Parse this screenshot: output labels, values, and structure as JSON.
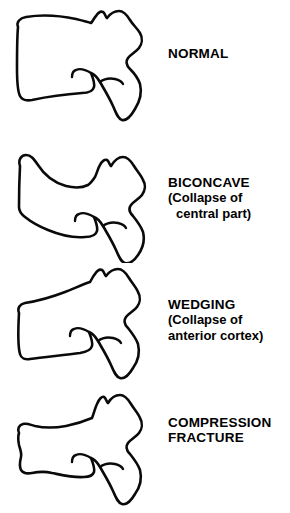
{
  "figure": {
    "background_color": "#ffffff",
    "line_color": "#0a0a0a"
  },
  "rows": [
    {
      "id": "normal",
      "title": "NORMAL",
      "sub1": "",
      "sub2": "",
      "drawing_name": "normal-vertebra-outline"
    },
    {
      "id": "biconcave",
      "title": "BICONCAVE",
      "sub1": "(Collapse of",
      "sub2": "central part)",
      "drawing_name": "biconcave-vertebra-outline"
    },
    {
      "id": "wedging",
      "title": "WEDGING",
      "sub1": "(Collapse of",
      "sub2": "anterior cortex)",
      "drawing_name": "wedging-vertebra-outline"
    },
    {
      "id": "compression",
      "title": "COMPRESSION",
      "sub1": "FRACTURE",
      "sub2": "",
      "drawing_name": "compression-fracture-vertebra-outline"
    }
  ]
}
